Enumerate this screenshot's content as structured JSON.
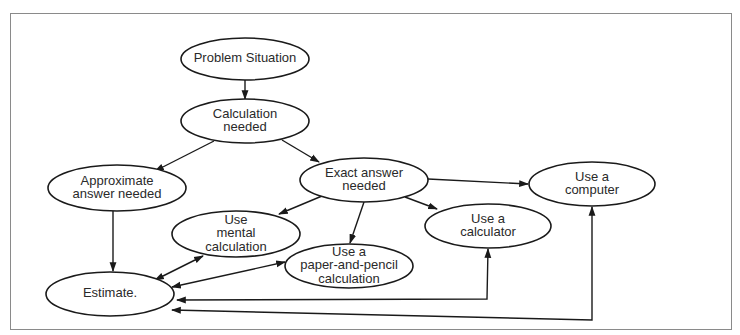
{
  "diagram": {
    "type": "flowchart",
    "nodes": [
      {
        "id": "problem",
        "lines": [
          "Problem Situation"
        ],
        "cx": 245,
        "cy": 59,
        "rx": 64,
        "ry": 21
      },
      {
        "id": "calc_needed",
        "lines": [
          "Calculation",
          "needed"
        ],
        "cx": 245,
        "cy": 121,
        "rx": 64,
        "ry": 22
      },
      {
        "id": "approx",
        "lines": [
          "Approximate",
          "answer needed"
        ],
        "cx": 117,
        "cy": 188,
        "rx": 69,
        "ry": 23
      },
      {
        "id": "exact",
        "lines": [
          "Exact answer",
          "needed"
        ],
        "cx": 364,
        "cy": 180,
        "rx": 64,
        "ry": 22
      },
      {
        "id": "computer",
        "lines": [
          "Use a",
          "computer"
        ],
        "cx": 592,
        "cy": 184,
        "rx": 63,
        "ry": 22
      },
      {
        "id": "calculator",
        "lines": [
          "Use a",
          "calculator"
        ],
        "cx": 488,
        "cy": 226,
        "rx": 63,
        "ry": 22
      },
      {
        "id": "mental",
        "lines": [
          "Use",
          "mental",
          "calculation"
        ],
        "cx": 236,
        "cy": 234,
        "rx": 64,
        "ry": 23
      },
      {
        "id": "paper",
        "lines": [
          "Use a",
          "paper-and-pencil",
          "calculation"
        ],
        "cx": 349,
        "cy": 266,
        "rx": 64,
        "ry": 22
      },
      {
        "id": "estimate",
        "lines": [
          "Estimate."
        ],
        "cx": 110,
        "cy": 294,
        "rx": 64,
        "ry": 22
      }
    ],
    "edges": [
      {
        "from": "problem",
        "to": "calc_needed",
        "points": [
          [
            245,
            80
          ],
          [
            245,
            99
          ]
        ],
        "arrow_end": true,
        "arrow_start": false
      },
      {
        "from": "calc_needed",
        "to": "approx",
        "points": [
          [
            214,
            141
          ],
          [
            155,
            171
          ]
        ],
        "arrow_end": true,
        "arrow_start": false
      },
      {
        "from": "calc_needed",
        "to": "exact",
        "points": [
          [
            282,
            140
          ],
          [
            319,
            162
          ]
        ],
        "arrow_end": true,
        "arrow_start": false
      },
      {
        "from": "exact",
        "to": "computer",
        "points": [
          [
            428,
            179
          ],
          [
            528,
            184
          ]
        ],
        "arrow_end": true,
        "arrow_start": false
      },
      {
        "from": "exact",
        "to": "calculator",
        "points": [
          [
            405,
            197
          ],
          [
            437,
            209
          ]
        ],
        "arrow_end": true,
        "arrow_start": false
      },
      {
        "from": "exact",
        "to": "mental",
        "points": [
          [
            322,
            196
          ],
          [
            279,
            214
          ]
        ],
        "arrow_end": true,
        "arrow_start": false
      },
      {
        "from": "exact",
        "to": "paper",
        "points": [
          [
            364,
            202
          ],
          [
            350,
            243
          ]
        ],
        "arrow_end": true,
        "arrow_start": false
      },
      {
        "from": "approx",
        "to": "estimate",
        "points": [
          [
            113,
            211
          ],
          [
            113,
            271
          ]
        ],
        "arrow_end": true,
        "arrow_start": false
      },
      {
        "from": "mental",
        "to": "estimate",
        "points": [
          [
            203,
            256
          ],
          [
            155,
            280
          ]
        ],
        "arrow_end": true,
        "arrow_start": true
      },
      {
        "from": "paper",
        "to": "estimate",
        "points": [
          [
            285,
            262
          ],
          [
            172,
            287
          ]
        ],
        "arrow_end": true,
        "arrow_start": true
      },
      {
        "from": "calculator",
        "to": "estimate",
        "points": [
          [
            488,
            249
          ],
          [
            487,
            299
          ],
          [
            177,
            300
          ]
        ],
        "arrow_end": true,
        "arrow_start": true
      },
      {
        "from": "computer",
        "to": "estimate",
        "points": [
          [
            592,
            207
          ],
          [
            592,
            320
          ],
          [
            172,
            310
          ]
        ],
        "arrow_end": true,
        "arrow_start": true
      }
    ],
    "colors": {
      "stroke": "#1a1a1a",
      "text": "#2a2a2a",
      "frame": "#8a8a8a",
      "background": "#ffffff"
    }
  }
}
